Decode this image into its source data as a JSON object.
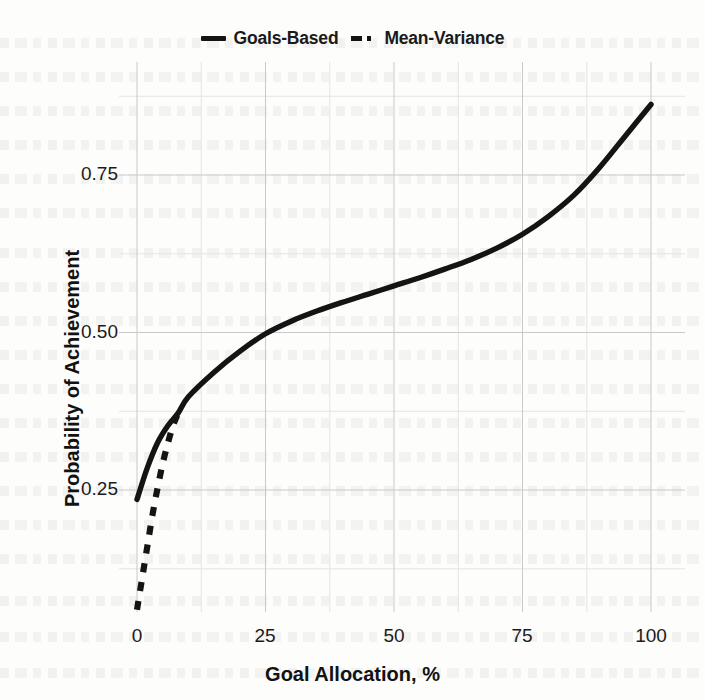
{
  "legend": {
    "position": "top-center",
    "entries": [
      {
        "label": "Goals-Based",
        "style": "solid",
        "swatch": "solid-line-swatch"
      },
      {
        "label": "Mean-Variance",
        "style": "dashed",
        "swatch": "dashed-line-swatch"
      }
    ]
  },
  "axes": {
    "x": {
      "label": "Goal Allocation, %",
      "ticks": [
        "0",
        "25",
        "50",
        "75",
        "100"
      ]
    },
    "y": {
      "label": "Probability of Achievement",
      "ticks": [
        "0.25",
        "0.50",
        "0.75"
      ]
    }
  },
  "colors": {
    "line": "#141414",
    "grid_major": "#c9c9c9",
    "grid_minor": "#e4e4e4",
    "background": "#fdfdfc",
    "text": "#111111"
  },
  "chart_data": {
    "type": "line",
    "title": "",
    "xlabel": "Goal Allocation, %",
    "ylabel": "Probability of Achievement",
    "xlim": [
      0,
      100
    ],
    "ylim": [
      0.0,
      0.92
    ],
    "xticks": [
      0,
      25,
      50,
      75,
      100
    ],
    "yticks": [
      0.25,
      0.5,
      0.75
    ],
    "grid": true,
    "minor_grid": true,
    "legend_position": "top-center",
    "series": [
      {
        "name": "Goals-Based",
        "style": "solid",
        "x": [
          0,
          2,
          4,
          6,
          8,
          10,
          15,
          20,
          25,
          30,
          35,
          40,
          45,
          50,
          55,
          60,
          65,
          70,
          75,
          80,
          85,
          90,
          95,
          100
        ],
        "values": [
          0.235,
          0.285,
          0.325,
          0.352,
          0.372,
          0.398,
          0.437,
          0.47,
          0.498,
          0.518,
          0.534,
          0.548,
          0.561,
          0.574,
          0.587,
          0.601,
          0.616,
          0.634,
          0.656,
          0.684,
          0.718,
          0.762,
          0.812,
          0.862
        ]
      },
      {
        "name": "Mean-Variance",
        "style": "dashed",
        "x": [
          0,
          1,
          2,
          3,
          4,
          5,
          6,
          7,
          8
        ],
        "values": [
          0.06,
          0.11,
          0.16,
          0.21,
          0.253,
          0.292,
          0.324,
          0.352,
          0.372
        ]
      }
    ]
  }
}
